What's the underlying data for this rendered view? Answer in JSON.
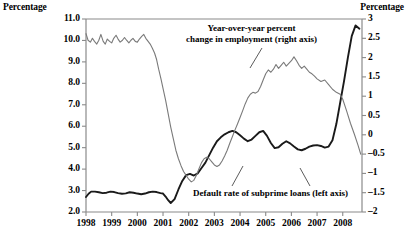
{
  "chart_data": {
    "type": "line",
    "title": "",
    "subtitle": "",
    "xlabel": "",
    "ylabel": "Percentage",
    "y2label": "Percentage",
    "grid": false,
    "legend_position": "inline-annotations",
    "x_range": [
      1998.0,
      2008.75
    ],
    "xticks": [
      "1998",
      "1999",
      "2000",
      "2001",
      "2002",
      "2003",
      "2004",
      "2005",
      "2006",
      "2007",
      "2008"
    ],
    "xtick_values": [
      1998,
      1999,
      2000,
      2001,
      2002,
      2003,
      2004,
      2005,
      2006,
      2007,
      2008
    ],
    "ylim": [
      2.0,
      11.0
    ],
    "yticks": [
      "2.0",
      "3.0",
      "4.0",
      "5.0",
      "6.0",
      "7.0",
      "8.0",
      "9.0",
      "10.0",
      "11.0"
    ],
    "ytick_values": [
      2.0,
      3.0,
      4.0,
      5.0,
      6.0,
      7.0,
      8.0,
      9.0,
      10.0,
      11.0
    ],
    "y2lim": [
      -2,
      3
    ],
    "y2ticks": [
      "-2",
      "-1.5",
      "-1",
      "-0.5",
      "0",
      "0.5",
      "1",
      "1.5",
      "2",
      "2.5",
      "3"
    ],
    "y2tick_values": [
      -2,
      -1.5,
      -1,
      -0.5,
      0,
      0.5,
      1,
      1.5,
      2,
      2.5,
      3
    ],
    "annotations": [
      {
        "id": "employment-label",
        "lines": [
          "Year-over-year percent",
          "change in employment (right axis)"
        ],
        "text": "Year-over-year percent change in employment (right axis)"
      },
      {
        "id": "default-label",
        "lines": [
          "Default rate of subprime loans (left axis)"
        ],
        "text": "Default rate of subprime loans (left axis)"
      }
    ],
    "series": [
      {
        "name": "Default rate of subprime loans (left axis)",
        "axis": "left",
        "color": "#1a1a1a",
        "linewidth": 1.9,
        "x": [
          1998.0,
          1998.1,
          1998.2,
          1998.35,
          1998.5,
          1998.65,
          1998.8,
          1998.95,
          1999.1,
          1999.25,
          1999.4,
          1999.55,
          1999.7,
          1999.85,
          2000.0,
          2000.15,
          2000.3,
          2000.45,
          2000.6,
          2000.75,
          2000.9,
          2001.0,
          2001.1,
          2001.2,
          2001.3,
          2001.45,
          2001.6,
          2001.75,
          2001.9,
          2002.05,
          2002.2,
          2002.35,
          2002.5,
          2002.65,
          2002.8,
          2002.95,
          2003.1,
          2003.25,
          2003.4,
          2003.55,
          2003.7,
          2003.85,
          2004.0,
          2004.15,
          2004.3,
          2004.45,
          2004.6,
          2004.75,
          2004.9,
          2005.05,
          2005.2,
          2005.35,
          2005.5,
          2005.65,
          2005.8,
          2005.95,
          2006.1,
          2006.25,
          2006.4,
          2006.55,
          2006.7,
          2006.85,
          2007.0,
          2007.15,
          2007.3,
          2007.45,
          2007.6,
          2007.75,
          2007.9,
          2008.05,
          2008.2,
          2008.35,
          2008.5,
          2008.65
        ],
        "y": [
          2.7,
          2.85,
          2.95,
          2.95,
          2.92,
          2.88,
          2.9,
          2.95,
          2.93,
          2.88,
          2.85,
          2.87,
          2.92,
          2.9,
          2.86,
          2.83,
          2.86,
          2.92,
          2.95,
          2.93,
          2.88,
          2.86,
          2.72,
          2.55,
          2.42,
          2.6,
          3.05,
          3.45,
          3.72,
          3.78,
          3.7,
          3.8,
          4.05,
          4.3,
          4.65,
          5.0,
          5.3,
          5.48,
          5.62,
          5.72,
          5.78,
          5.72,
          5.58,
          5.42,
          5.3,
          5.38,
          5.55,
          5.72,
          5.78,
          5.55,
          5.22,
          4.98,
          5.02,
          5.18,
          5.3,
          5.2,
          5.05,
          4.92,
          4.88,
          4.95,
          5.05,
          5.1,
          5.12,
          5.08,
          5.0,
          5.05,
          5.35,
          6.1,
          7.1,
          8.1,
          9.2,
          10.2,
          10.7,
          10.55
        ]
      },
      {
        "name": "Year-over-year percent change in employment (right axis)",
        "axis": "right",
        "color": "#7a7a7a",
        "linewidth": 1.1,
        "x": [
          1998.0,
          1998.08,
          1998.17,
          1998.25,
          1998.33,
          1998.42,
          1998.5,
          1998.58,
          1998.67,
          1998.75,
          1998.83,
          1998.92,
          1999.0,
          1999.08,
          1999.17,
          1999.25,
          1999.33,
          1999.42,
          1999.5,
          1999.58,
          1999.67,
          1999.75,
          1999.83,
          1999.92,
          2000.0,
          2000.08,
          2000.17,
          2000.25,
          2000.33,
          2000.42,
          2000.5,
          2000.58,
          2000.67,
          2000.75,
          2000.83,
          2000.92,
          2001.0,
          2001.1,
          2001.2,
          2001.3,
          2001.4,
          2001.5,
          2001.6,
          2001.7,
          2001.8,
          2001.9,
          2002.0,
          2002.1,
          2002.2,
          2002.3,
          2002.4,
          2002.5,
          2002.6,
          2002.7,
          2002.8,
          2002.9,
          2003.0,
          2003.1,
          2003.2,
          2003.3,
          2003.4,
          2003.5,
          2003.6,
          2003.7,
          2003.8,
          2003.9,
          2004.0,
          2004.1,
          2004.2,
          2004.3,
          2004.4,
          2004.5,
          2004.6,
          2004.7,
          2004.8,
          2004.9,
          2005.0,
          2005.1,
          2005.2,
          2005.3,
          2005.4,
          2005.5,
          2005.6,
          2005.7,
          2005.8,
          2005.9,
          2006.0,
          2006.1,
          2006.2,
          2006.3,
          2006.4,
          2006.5,
          2006.6,
          2006.7,
          2006.8,
          2006.9,
          2007.0,
          2007.15,
          2007.3,
          2007.45,
          2007.6,
          2007.75,
          2007.9,
          2008.0,
          2008.15,
          2008.3,
          2008.45,
          2008.6,
          2008.7
        ],
        "y": [
          2.62,
          2.45,
          2.4,
          2.5,
          2.42,
          2.35,
          2.45,
          2.6,
          2.42,
          2.35,
          2.48,
          2.42,
          2.38,
          2.5,
          2.58,
          2.48,
          2.4,
          2.45,
          2.52,
          2.45,
          2.38,
          2.45,
          2.5,
          2.42,
          2.4,
          2.48,
          2.55,
          2.6,
          2.5,
          2.42,
          2.35,
          2.25,
          2.12,
          1.95,
          1.7,
          1.45,
          1.2,
          0.9,
          0.55,
          0.2,
          -0.1,
          -0.4,
          -0.62,
          -0.8,
          -0.95,
          -1.05,
          -1.15,
          -1.22,
          -1.18,
          -1.05,
          -0.88,
          -0.72,
          -0.62,
          -0.58,
          -0.62,
          -0.7,
          -0.78,
          -0.82,
          -0.78,
          -0.68,
          -0.55,
          -0.4,
          -0.22,
          -0.05,
          0.12,
          0.28,
          0.45,
          0.62,
          0.8,
          0.95,
          1.05,
          1.1,
          1.08,
          1.12,
          1.25,
          1.42,
          1.58,
          1.68,
          1.62,
          1.7,
          1.82,
          1.72,
          1.8,
          1.88,
          1.78,
          1.85,
          1.92,
          2.02,
          1.92,
          1.8,
          1.72,
          1.78,
          1.7,
          1.62,
          1.58,
          1.52,
          1.45,
          1.38,
          1.42,
          1.3,
          1.18,
          1.1,
          1.05,
          0.92,
          0.62,
          0.3,
          0.02,
          -0.28,
          -0.5
        ]
      }
    ]
  },
  "axes": {
    "left_title": "Percentage",
    "right_title": "Percentage"
  }
}
